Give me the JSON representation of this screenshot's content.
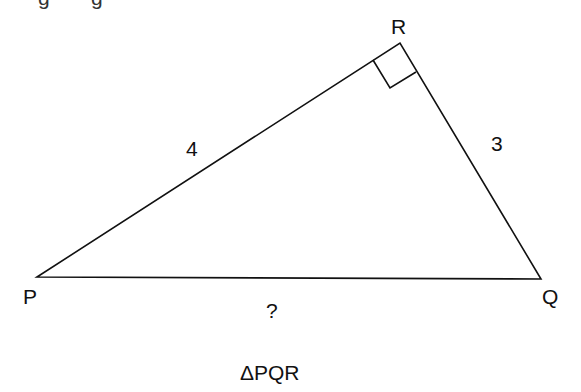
{
  "diagram": {
    "title": "ΔPQR",
    "vertices": {
      "P": {
        "label": "P",
        "x": 37,
        "y": 277
      },
      "Q": {
        "label": "Q",
        "x": 541,
        "y": 279
      },
      "R": {
        "label": "R",
        "x": 400,
        "y": 43
      }
    },
    "sides": {
      "PR": {
        "label": "4"
      },
      "RQ": {
        "label": "3"
      },
      "PQ": {
        "label": "?"
      }
    },
    "right_angle_at": "R",
    "top_fragments": [
      "g",
      "g"
    ]
  }
}
